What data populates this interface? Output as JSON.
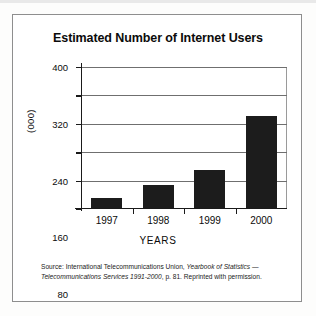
{
  "figure": {
    "title": "Estimated Number of Internet Users",
    "y_axis_label": "(000)",
    "x_axis_label": "YEARS"
  },
  "source_note": {
    "prefix": "Source: International Telecommunications Union, ",
    "italic_1": "Yearbook of Statistics",
    "middle": " — ",
    "italic_2": "Telecommunications Services 1991-2000",
    "suffix": ", p. 81. Reprinted with permission."
  },
  "chart_data": {
    "type": "bar",
    "title": "Estimated Number of Internet Users",
    "xlabel": "YEARS",
    "ylabel": "(000)",
    "categories": [
      "1997",
      "1998",
      "1999",
      "2000"
    ],
    "values": [
      27,
      65,
      108,
      258
    ],
    "ylim": [
      0,
      400
    ],
    "yticks": [
      0,
      80,
      160,
      240,
      320,
      400
    ],
    "ytick_labels": [
      "0",
      "80",
      "160",
      "240",
      "320",
      "400"
    ],
    "grid": true,
    "legend": false,
    "bar_color": "#1c1c1c"
  }
}
